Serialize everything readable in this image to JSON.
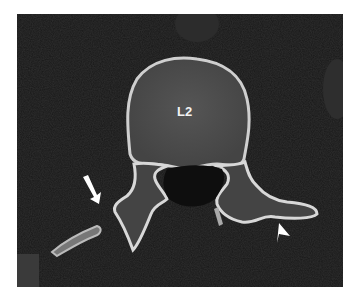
{
  "image": {
    "type": "axial CT scan",
    "vertebra_label": "L2",
    "annotations": [
      {
        "type": "arrow",
        "position": "left transverse process region"
      },
      {
        "type": "arrowhead",
        "position": "right transverse process region"
      }
    ],
    "colors": {
      "background": "#1a1a1a",
      "bone_cortex": "#d8d8d8",
      "bone_marrow": "#4a4a4a",
      "soft_tissue": "#2a2a2a",
      "annotation": "#ffffff"
    }
  }
}
